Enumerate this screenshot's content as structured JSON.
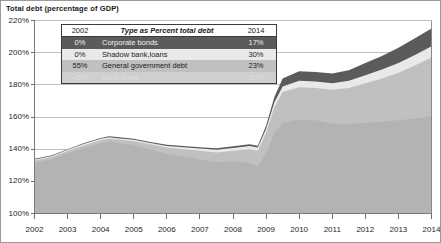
{
  "figure": {
    "title": "Total debt (percentage of GDP)",
    "frame_color": "#9a9a9a",
    "background": "#ffffff"
  },
  "legend": {
    "header": {
      "left": "2002",
      "middle": "Type as Percent total debt",
      "right": "2014"
    },
    "rows": [
      {
        "start": "0%",
        "label": "Corporate bonds",
        "end": "17%",
        "color": "#5b5b5b"
      },
      {
        "start": "0%",
        "label": "Shadow bank,loans",
        "end": "30%",
        "color": "#e9e9e9"
      },
      {
        "start": "55%",
        "label": "General government debt",
        "end": "23%",
        "color": "#c0c0c0"
      },
      {
        "start": "45%",
        "label": "Bank loans",
        "end": "30%",
        "color": "#b3b3b3"
      }
    ]
  },
  "chart_data": {
    "type": "area",
    "stacked": true,
    "title": "Total debt (percentage of GDP)",
    "xlabel": "",
    "ylabel": "",
    "xlim": [
      2002,
      2014
    ],
    "ylim": [
      100,
      220
    ],
    "yticks": [
      100,
      120,
      140,
      160,
      180,
      200,
      220
    ],
    "ytick_labels": [
      "100%",
      "120%",
      "140%",
      "160%",
      "180%",
      "200%",
      "220%"
    ],
    "xticks": [
      2002,
      2003,
      2004,
      2005,
      2006,
      2007,
      2008,
      2009,
      2010,
      2011,
      2012,
      2013,
      2014
    ],
    "xtick_labels": [
      "2002",
      "2003",
      "2004",
      "2005",
      "2006",
      "2007",
      "2008",
      "2009",
      "2010",
      "2011",
      "2012",
      "2013",
      "2014"
    ],
    "grid": true,
    "grid_axis": "y",
    "legend_position": "upper-left-inside",
    "x": [
      2002,
      2002.5,
      2003,
      2003.5,
      2004,
      2004.25,
      2004.5,
      2005,
      2005.5,
      2006,
      2006.5,
      2007,
      2007.5,
      2008,
      2008.5,
      2008.75,
      2009,
      2009.25,
      2009.5,
      2010,
      2010.5,
      2011,
      2011.5,
      2012,
      2012.5,
      2013,
      2013.5,
      2014
    ],
    "series": [
      {
        "name": "Bank loans",
        "color": "#b3b3b3",
        "cumulative_top": [
          131.5,
          133.5,
          137.5,
          140.5,
          143.5,
          145.0,
          144.0,
          142.5,
          140.0,
          137.0,
          135.5,
          133.5,
          132.0,
          132.5,
          131.5,
          129.5,
          137.0,
          150.0,
          156.5,
          158.5,
          158.0,
          156.0,
          155.5,
          156.5,
          157.0,
          158.0,
          159.0,
          160.5
        ]
      },
      {
        "name": "General government debt",
        "color": "#c0c0c0",
        "cumulative_top": [
          133.0,
          135.0,
          139.0,
          142.5,
          145.5,
          146.5,
          146.0,
          145.0,
          143.0,
          141.0,
          140.0,
          139.0,
          138.0,
          139.0,
          140.0,
          139.0,
          150.0,
          166.0,
          175.5,
          178.5,
          178.0,
          177.0,
          178.0,
          181.0,
          184.0,
          187.5,
          192.0,
          197.0
        ]
      },
      {
        "name": "Shadow bank,loans",
        "color": "#e9e9e9",
        "cumulative_top": [
          133.6,
          135.6,
          139.6,
          143.3,
          146.4,
          147.4,
          146.8,
          145.8,
          143.9,
          142.0,
          141.2,
          140.4,
          139.6,
          140.8,
          141.9,
          141.0,
          152.5,
          169.0,
          179.0,
          182.5,
          182.0,
          181.0,
          182.5,
          186.0,
          189.5,
          193.5,
          198.5,
          204.0
        ]
      },
      {
        "name": "Corporate bonds",
        "color": "#5b5b5b",
        "cumulative_top": [
          134.0,
          136.0,
          140.0,
          143.8,
          147.0,
          148.0,
          147.5,
          146.5,
          144.5,
          142.8,
          142.0,
          141.2,
          140.5,
          141.8,
          143.0,
          142.2,
          154.5,
          172.5,
          184.0,
          188.5,
          188.0,
          187.0,
          189.0,
          193.5,
          198.0,
          203.0,
          209.0,
          215.0
        ]
      }
    ]
  }
}
